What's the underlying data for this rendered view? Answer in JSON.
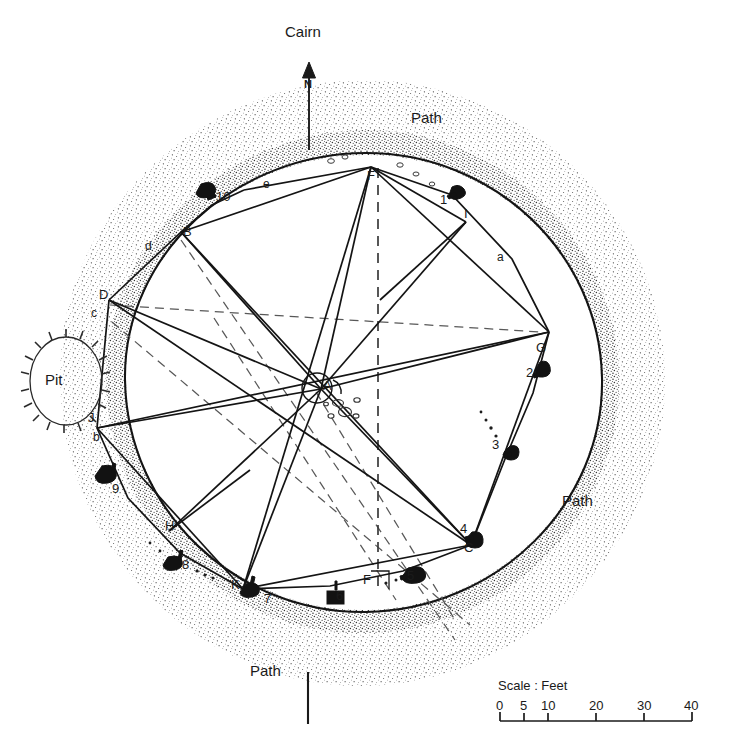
{
  "figure": {
    "title_labels": {
      "cairn": "Cairn",
      "north": "N",
      "pit": "Pit"
    },
    "path_labels": [
      {
        "text": "Path",
        "x": 411,
        "y": 110
      },
      {
        "text": "Path",
        "x": 562,
        "y": 500
      },
      {
        "text": "Path",
        "x": 277,
        "y": 670
      }
    ],
    "scale": {
      "caption": "Scale : Feet",
      "ticks": [
        "0",
        "5",
        "10",
        "20",
        "30",
        "40"
      ],
      "tick_values": [
        0,
        5,
        10,
        20,
        30,
        40
      ],
      "unit": "Feet"
    },
    "vertices": [
      {
        "label": "A",
        "x": 321,
        "y": 386
      },
      {
        "label": "B",
        "x": 180,
        "y": 232
      },
      {
        "label": "C",
        "x": 468,
        "y": 548
      },
      {
        "label": "D",
        "x": 106,
        "y": 295
      },
      {
        "label": "F",
        "x": 371,
        "y": 175
      },
      {
        "label": "F",
        "x": 382,
        "y": 589
      },
      {
        "label": "G",
        "x": 541,
        "y": 348
      },
      {
        "label": "H",
        "x": 169,
        "y": 526
      },
      {
        "label": "I",
        "x": 466,
        "y": 214
      },
      {
        "label": "J",
        "x": 90,
        "y": 418
      },
      {
        "label": "K",
        "x": 235,
        "y": 586
      }
    ],
    "stones": [
      {
        "label": "1",
        "x": 444,
        "y": 200
      },
      {
        "label": "2",
        "x": 531,
        "y": 373
      },
      {
        "label": "3",
        "x": 497,
        "y": 445
      },
      {
        "label": "4",
        "x": 464,
        "y": 529
      },
      {
        "label": "5",
        "x": 411,
        "y": 576
      },
      {
        "label": "6",
        "x": 340,
        "y": 596
      },
      {
        "label": "7",
        "x": 268,
        "y": 599
      },
      {
        "label": "8",
        "x": 186,
        "y": 565
      },
      {
        "label": "9",
        "x": 116,
        "y": 489
      },
      {
        "label": "10",
        "x": 222,
        "y": 197
      }
    ],
    "arc_labels": [
      {
        "label": "a",
        "x": 500,
        "y": 257
      },
      {
        "label": "b",
        "x": 96,
        "y": 437
      },
      {
        "label": "c",
        "x": 94,
        "y": 313
      },
      {
        "label": "d",
        "x": 148,
        "y": 246
      },
      {
        "label": "e",
        "x": 266,
        "y": 184
      }
    ],
    "colors": {
      "ink": "#1a1a1a",
      "stipple": "#4a4a4a",
      "dashed": "#555555",
      "background": "#ffffff"
    }
  }
}
